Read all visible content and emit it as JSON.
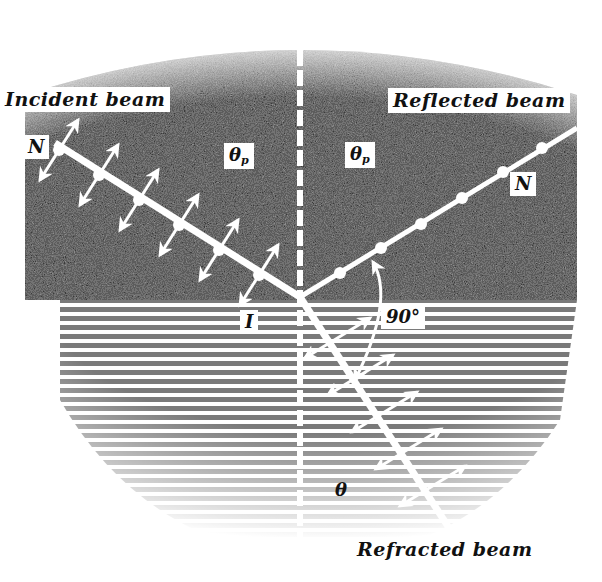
{
  "diagram": {
    "labels": {
      "incident_beam": "Incident beam",
      "reflected_beam": "Reflected beam",
      "refracted_beam": "Refracted beam",
      "normal_incident": "N",
      "normal_reflected": "N",
      "theta_p_left": "θ",
      "theta_p_left_sub": "p",
      "theta_p_right": "θ",
      "theta_p_right_sub": "p",
      "interface": "I",
      "right_angle": "90°",
      "theta_refracted": "θ"
    },
    "media": {
      "upper": "dark stippled region (incident medium)",
      "lower": "horizontally hatched region (refracting medium)"
    },
    "beams": [
      {
        "name": "incident",
        "direction": "upper-left to point of incidence",
        "polarization_marks": "double-headed arrows in plane of incidence plus dots"
      },
      {
        "name": "reflected",
        "direction": "point of incidence to upper-right",
        "polarization_marks": "dots (perpendicular to plane)"
      },
      {
        "name": "refracted",
        "direction": "point of incidence to lower-right",
        "polarization_marks": "double-headed arrows in plane of incidence"
      }
    ],
    "angle_between_reflected_and_refracted": "90°",
    "colors": {
      "upper_medium": "#3a3a3a",
      "lower_medium": "#8a8a8a",
      "beam": "#ffffff",
      "text": "#111111"
    }
  }
}
